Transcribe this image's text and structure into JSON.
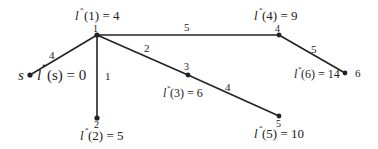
{
  "diagram": {
    "type": "shortest-path-tree",
    "nodes": [
      {
        "id": "s",
        "label": "s",
        "x": 30,
        "y": 75,
        "distance_label": "l*(s) = 0"
      },
      {
        "id": "1",
        "label": "1",
        "x": 97,
        "y": 35,
        "distance_label": "l*(1) = 4"
      },
      {
        "id": "2",
        "label": "2",
        "x": 97,
        "y": 118,
        "distance_label": "l*(2) = 5"
      },
      {
        "id": "3",
        "label": "3",
        "x": 188,
        "y": 75,
        "distance_label": "l*(3) = 6"
      },
      {
        "id": "4",
        "label": "4",
        "x": 279,
        "y": 35,
        "distance_label": "l*(4) = 9"
      },
      {
        "id": "5",
        "label": "5",
        "x": 279,
        "y": 116,
        "distance_label": "l*(5) = 10"
      },
      {
        "id": "6",
        "label": "6",
        "x": 345,
        "y": 73,
        "distance_label": "l*(6) = 14"
      }
    ],
    "edges": [
      {
        "from": "s",
        "to": "1",
        "weight": "4"
      },
      {
        "from": "1",
        "to": "2",
        "weight": "1"
      },
      {
        "from": "1",
        "to": "3",
        "weight": "2"
      },
      {
        "from": "1",
        "to": "4",
        "weight": "5"
      },
      {
        "from": "3",
        "to": "5",
        "weight": "4"
      },
      {
        "from": "4",
        "to": "6",
        "weight": "5"
      }
    ],
    "text": {
      "s_name": "s",
      "s_dist_l": "l",
      "s_dist_rest": "(s) = 0",
      "n1_num": "1",
      "n1_dist_l": "l",
      "n1_dist_rest": "(1) = 4",
      "n2_num": "2",
      "n2_dist_l": "l",
      "n2_dist_rest": "(2) = 5",
      "n3_num": "3",
      "n3_dist_l": "l",
      "n3_dist_rest": "(3) = 6",
      "n4_num": "4",
      "n4_dist_l": "l",
      "n4_dist_rest": "(4) = 9",
      "n5_num": "5",
      "n5_dist_l": "l",
      "n5_dist_rest": "(5) = 10",
      "n6_num": "6",
      "n6_dist_l": "l",
      "n6_dist_rest": "(6) = 14",
      "star": "*",
      "w_s1": "4",
      "w_12": "1",
      "w_13": "2",
      "w_14": "5",
      "w_35": "4",
      "w_46": "5"
    }
  }
}
